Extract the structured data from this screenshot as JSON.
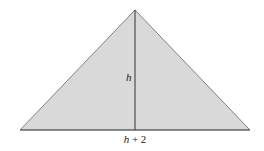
{
  "diagram": {
    "type": "isosceles-triangle",
    "colors": {
      "fill": "#d9d9d9",
      "stroke": "#555555",
      "altitude": "#333333",
      "background": "#ffffff"
    },
    "vertices": {
      "apex": [
        135,
        10
      ],
      "base_left": [
        20,
        130
      ],
      "base_right": [
        250,
        130
      ]
    },
    "altitude": {
      "from": [
        135,
        10
      ],
      "to": [
        135,
        130
      ]
    },
    "labels": {
      "height": "h",
      "base": "h + 2"
    }
  }
}
